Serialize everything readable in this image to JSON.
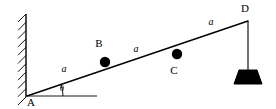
{
  "figure": {
    "type": "statics-free-body-diagram",
    "background_color": "#ffffff",
    "line_color": "#000000",
    "mass_color": "#000000",
    "weight_color": "#000000"
  },
  "wall": {
    "name": "vertical-support-wall",
    "x": 26,
    "top": 14,
    "bottom": 97,
    "hatch_count": 11,
    "hatch_length": 8
  },
  "beam": {
    "name": "inclined-beam",
    "start": {
      "x": 27,
      "y": 96
    },
    "end": {
      "x": 248,
      "y": 21
    },
    "stroke_width": 1.4
  },
  "horizontal_reference": {
    "name": "horizontal-reference-line",
    "start": {
      "x": 27,
      "y": 96
    },
    "end": {
      "x": 97,
      "y": 96
    },
    "stroke_width": 0.9
  },
  "angle": {
    "label": "θ",
    "label_x": 62,
    "label_y": 91,
    "arc_radius": 36
  },
  "points": [
    {
      "id": "A",
      "label": "A",
      "label_x": 31,
      "label_y": 106,
      "marker": "hinge",
      "x": 27,
      "y": 96,
      "radius": 0
    },
    {
      "id": "B",
      "label": "B",
      "label_x": 99,
      "label_y": 47,
      "marker": "filled-circle",
      "x": 105,
      "y": 62,
      "radius": 5.2
    },
    {
      "id": "C",
      "label": "C",
      "label_x": 174,
      "label_y": 74,
      "marker": "filled-circle",
      "x": 177,
      "y": 54,
      "radius": 5.2
    },
    {
      "id": "D",
      "label": "D",
      "label_x": 245,
      "label_y": 12,
      "marker": "endpoint",
      "x": 248,
      "y": 21,
      "radius": 0
    }
  ],
  "segment_labels": [
    {
      "label": "a",
      "x": 64,
      "y": 72,
      "between": "A-B"
    },
    {
      "label": "a",
      "x": 136,
      "y": 52,
      "between": "B-C"
    },
    {
      "label": "a",
      "x": 211,
      "y": 25,
      "between": "C-D"
    }
  ],
  "hanging_load": {
    "name": "hanging-weight",
    "cord": {
      "x": 248,
      "top": 21,
      "bottom": 70
    },
    "block": {
      "top_y": 70,
      "bottom_y": 84,
      "top_half_width": 9,
      "bottom_half_width": 14,
      "center_x": 248
    }
  }
}
